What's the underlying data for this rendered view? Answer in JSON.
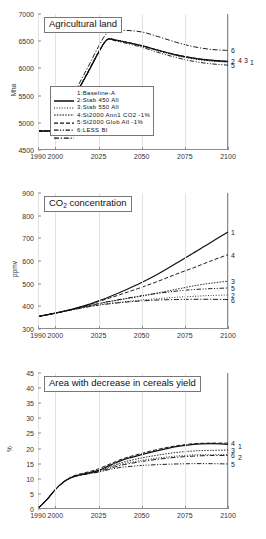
{
  "figure": {
    "x_ticks": [
      1990,
      2000,
      2025,
      2050,
      2075,
      2100
    ],
    "x_tick_labels": [
      "1990",
      "2000",
      "2025",
      "2050",
      "2075",
      "2100"
    ],
    "xlim": [
      1990,
      2100
    ]
  },
  "legend": {
    "entries": [
      {
        "num": "1:",
        "label": "Baseline-A",
        "style": "solid"
      },
      {
        "num": "2:",
        "label": "Stab 450 All",
        "style": "dotted"
      },
      {
        "num": "3:",
        "label": "Stab 550 All",
        "style": "densely-dotted"
      },
      {
        "num": "4:",
        "label": "St2000 Ann1 CO2  -1%",
        "style": "dashed"
      },
      {
        "num": "5:",
        "label": "St2000 Glob All  -1%",
        "style": "dashdotdot"
      },
      {
        "num": "6:",
        "label": "LESS BI",
        "style": "dashdot"
      }
    ]
  },
  "chart_data": [
    {
      "type": "line",
      "title": "Agricultural land",
      "xlabel": "",
      "ylabel": "Mha",
      "ylim": [
        4500,
        7000
      ],
      "y_ticks": [
        4500,
        5000,
        5500,
        6000,
        6500,
        7000
      ],
      "y_tick_labels": [
        "4500",
        "5000",
        "5500",
        "6000",
        "6500",
        "7000"
      ],
      "grid": "vertical",
      "legend_position": "inside-bottom-center",
      "x": [
        1990,
        1995,
        2000,
        2005,
        2010,
        2015,
        2020,
        2025,
        2030,
        2035,
        2040,
        2050,
        2060,
        2070,
        2080,
        2090,
        2100
      ],
      "series": [
        {
          "name": "1",
          "label": "Baseline-A",
          "style": "solid",
          "values": [
            4850,
            4850,
            4870,
            5130,
            5420,
            5700,
            5990,
            6290,
            6530,
            6520,
            6490,
            6420,
            6330,
            6250,
            6190,
            6150,
            6130
          ]
        },
        {
          "name": "2",
          "label": "Stab 450 All",
          "style": "dotted",
          "values": [
            4850,
            4850,
            4870,
            5130,
            5420,
            5700,
            5990,
            6290,
            6525,
            6515,
            6485,
            6410,
            6320,
            6235,
            6175,
            6135,
            6115
          ]
        },
        {
          "name": "3",
          "label": "Stab 550 All",
          "style": "densely-dotted",
          "values": [
            4850,
            4850,
            4870,
            5130,
            5420,
            5700,
            5990,
            6290,
            6528,
            6518,
            6488,
            6415,
            6325,
            6240,
            6180,
            6140,
            6120
          ]
        },
        {
          "name": "4",
          "label": "St2000 Ann1 CO2 -1%",
          "style": "dashed",
          "values": [
            4850,
            4850,
            4870,
            5135,
            5430,
            5715,
            6005,
            6300,
            6530,
            6520,
            6490,
            6420,
            6330,
            6250,
            6190,
            6150,
            6125
          ]
        },
        {
          "name": "5",
          "label": "St2000 Glob All -1%",
          "style": "dashdotdot",
          "values": [
            4850,
            4850,
            4870,
            5130,
            5420,
            5700,
            5985,
            6285,
            6520,
            6505,
            6470,
            6390,
            6290,
            6200,
            6130,
            6085,
            6060
          ]
        },
        {
          "name": "6",
          "label": "LESS BI",
          "style": "dashdot",
          "values": [
            4850,
            4855,
            4890,
            5180,
            5490,
            5790,
            6090,
            6400,
            6650,
            6690,
            6700,
            6670,
            6580,
            6480,
            6400,
            6350,
            6330
          ]
        }
      ],
      "end_labels": [
        {
          "num": "6",
          "value": 6330,
          "dx": 0
        },
        {
          "num": "2",
          "value": 6140,
          "dx": 0
        },
        {
          "num": "4",
          "value": 6150,
          "dx": 7
        },
        {
          "num": "3",
          "value": 6150,
          "dx": 13
        },
        {
          "num": "1",
          "value": 6120,
          "dx": 19
        },
        {
          "num": "5",
          "value": 6060,
          "dx": 0
        }
      ]
    },
    {
      "type": "line",
      "title": "CO2 concentration",
      "title_html": "CO<sub>2</sub> concentration",
      "xlabel": "",
      "ylabel": "ppmv",
      "ylim": [
        300,
        900
      ],
      "y_ticks": [
        300,
        400,
        500,
        600,
        700,
        800,
        900
      ],
      "y_tick_labels": [
        "300",
        "400",
        "500",
        "600",
        "700",
        "800",
        "900"
      ],
      "grid": "vertical",
      "legend_position": "right-edge-labels",
      "x": [
        1990,
        2000,
        2010,
        2020,
        2025,
        2030,
        2040,
        2050,
        2060,
        2070,
        2080,
        2090,
        2100
      ],
      "series": [
        {
          "name": "1",
          "label": "Baseline-A",
          "style": "solid",
          "values": [
            355,
            370,
            388,
            410,
            424,
            438,
            470,
            505,
            545,
            590,
            635,
            682,
            728
          ]
        },
        {
          "name": "2",
          "label": "Stab 450 All",
          "style": "dotted",
          "values": [
            355,
            370,
            385,
            400,
            406,
            412,
            420,
            428,
            434,
            440,
            444,
            448,
            450
          ]
        },
        {
          "name": "3",
          "label": "Stab 550 All",
          "style": "densely-dotted",
          "values": [
            355,
            370,
            386,
            403,
            411,
            419,
            432,
            445,
            460,
            475,
            490,
            502,
            511
          ]
        },
        {
          "name": "4",
          "label": "St2000 Ann1 CO2 -1%",
          "style": "dashed",
          "values": [
            355,
            370,
            388,
            409,
            421,
            433,
            458,
            484,
            512,
            542,
            570,
            600,
            628
          ]
        },
        {
          "name": "5",
          "label": "St2000 Glob All -1%",
          "style": "dashdotdot",
          "values": [
            355,
            370,
            386,
            404,
            412,
            420,
            434,
            447,
            458,
            467,
            474,
            478,
            481
          ]
        },
        {
          "name": "6",
          "label": "LESS BI",
          "style": "dashdot",
          "values": [
            355,
            370,
            385,
            399,
            405,
            410,
            418,
            424,
            428,
            430,
            431,
            431,
            430
          ]
        }
      ],
      "end_labels": [
        {
          "num": "1",
          "value": 728,
          "dx": 0
        },
        {
          "num": "4",
          "value": 628,
          "dx": 0
        },
        {
          "num": "3",
          "value": 511,
          "dx": 0
        },
        {
          "num": "5",
          "value": 481,
          "dx": 0
        },
        {
          "num": "2",
          "value": 452,
          "dx": 0
        },
        {
          "num": "6",
          "value": 430,
          "dx": 0
        }
      ]
    },
    {
      "type": "line",
      "title": "Area with decrease in cereals yield",
      "xlabel": "",
      "ylabel": "%",
      "ylim": [
        0,
        45
      ],
      "y_ticks": [
        0,
        5,
        10,
        15,
        20,
        25,
        30,
        35,
        40,
        45
      ],
      "y_tick_labels": [
        "0",
        "5",
        "10",
        "15",
        "20",
        "25",
        "30",
        "35",
        "40",
        "45"
      ],
      "grid": "vertical",
      "legend_position": "right-edge-labels",
      "x": [
        1990,
        1995,
        2000,
        2005,
        2010,
        2015,
        2020,
        2025,
        2030,
        2035,
        2040,
        2050,
        2060,
        2070,
        2080,
        2090,
        2100
      ],
      "series": [
        {
          "name": "1",
          "label": "Baseline-A",
          "style": "solid",
          "values": [
            0.2,
            3.0,
            6.4,
            9.0,
            10.6,
            11.4,
            12.0,
            12.8,
            14.0,
            15.3,
            16.4,
            18.0,
            19.4,
            20.6,
            21.4,
            21.6,
            21.4
          ]
        },
        {
          "name": "2",
          "label": "Stab 450 All",
          "style": "dotted",
          "values": [
            0.2,
            3.0,
            6.4,
            9.0,
            10.6,
            11.4,
            11.9,
            12.6,
            13.5,
            14.4,
            15.1,
            16.1,
            16.9,
            17.5,
            17.9,
            18.0,
            18.0
          ]
        },
        {
          "name": "3",
          "label": "Stab 550 All",
          "style": "densely-dotted",
          "values": [
            0.2,
            3.0,
            6.4,
            9.0,
            10.6,
            11.4,
            12.0,
            12.7,
            13.7,
            14.7,
            15.6,
            16.9,
            17.9,
            18.7,
            19.2,
            19.4,
            19.5
          ]
        },
        {
          "name": "4",
          "label": "St2000 Ann1 CO2 -1%",
          "style": "dashed",
          "values": [
            0.2,
            3.0,
            6.4,
            9.1,
            10.8,
            11.7,
            12.4,
            13.3,
            14.5,
            15.7,
            16.8,
            18.4,
            19.8,
            20.9,
            21.6,
            21.8,
            21.8
          ]
        },
        {
          "name": "5",
          "label": "St2000 Glob All -1%",
          "style": "dashdotdot",
          "values": [
            0.2,
            3.0,
            6.4,
            9.0,
            10.5,
            11.2,
            11.7,
            12.2,
            12.9,
            13.5,
            13.9,
            14.4,
            14.7,
            14.9,
            15.0,
            15.0,
            14.9
          ]
        },
        {
          "name": "6",
          "label": "LESS BI",
          "style": "dashdot",
          "values": [
            0.2,
            3.0,
            6.4,
            9.0,
            10.5,
            11.3,
            11.8,
            12.4,
            13.2,
            14.0,
            14.7,
            15.7,
            16.5,
            17.1,
            17.5,
            17.7,
            17.7
          ]
        }
      ],
      "end_labels": [
        {
          "num": "4",
          "value": 21.9,
          "dx": 0
        },
        {
          "num": "1",
          "value": 21.0,
          "dx": 7
        },
        {
          "num": "3",
          "value": 19.5,
          "dx": 0
        },
        {
          "num": "6",
          "value": 17.9,
          "dx": 0
        },
        {
          "num": "2",
          "value": 17.3,
          "dx": 7
        },
        {
          "num": "5",
          "value": 14.9,
          "dx": 0
        }
      ]
    }
  ]
}
